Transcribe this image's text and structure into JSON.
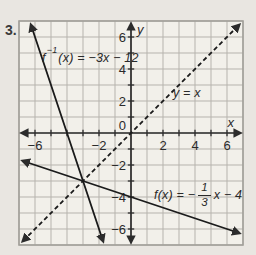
{
  "problem_number": "3.",
  "colors": {
    "page_bg": "#e9e6e1",
    "plot_bg": "#f2f0ea",
    "grid": "#b6b3ad",
    "border": "#a2a09a",
    "axis": "#2c2c2c",
    "line": "#1b1b1b",
    "text": "#2a2a2a"
  },
  "labels": {
    "f_inverse": {
      "fname": "f",
      "exponent": "−1",
      "rest": "(x) = −3x − 12"
    },
    "identity": "y = x",
    "f": {
      "pre": "f(x) = −",
      "numerator": "1",
      "denominator": "3",
      "post": "x − 4"
    }
  },
  "chart_data": {
    "type": "line",
    "title": "",
    "axes": {
      "xlabel": "x",
      "ylabel": "y",
      "xlim": [
        -7,
        7
      ],
      "ylim": [
        -7,
        7
      ],
      "grid": true,
      "grid_step": 1,
      "x_tick_labels": [
        -6,
        -2,
        2,
        4,
        6
      ],
      "y_tick_labels": [
        6,
        4,
        2,
        0,
        -2,
        -4,
        -6
      ]
    },
    "series": [
      {
        "name": "f-inverse-line",
        "equation": "f⁻¹(x) = −3x − 12",
        "slope": -3,
        "intercept": -12,
        "dash": false
      },
      {
        "name": "identity-line",
        "equation": "y = x",
        "slope": 1,
        "intercept": 0,
        "dash": true
      },
      {
        "name": "f-line",
        "equation": "f(x) = −(1/3)x − 4",
        "slope": -0.333333,
        "intercept": -4,
        "dash": false
      }
    ]
  }
}
